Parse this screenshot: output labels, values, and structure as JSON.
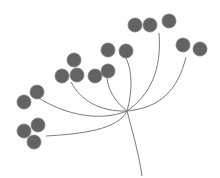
{
  "illustration": {
    "subject": "umbel flower head (dill-like) with seed clusters",
    "colors": {
      "background": "#ffffff",
      "stem": "#7a7a7a",
      "seed_fill": "#636363",
      "seed_outline": "#7d7d7d"
    },
    "cluster_count": 8,
    "seed_count": 17
  }
}
